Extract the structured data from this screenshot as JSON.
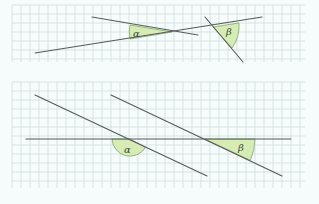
{
  "colors": {
    "background": "#f6fbfb",
    "grid": "#c9d6d4",
    "line": "#555a5a",
    "angle_fill": "#d6ecb4",
    "angle_stroke": "#7fa86a"
  },
  "panels": [
    {
      "name": "top-panel",
      "grid": {
        "x0": 12,
        "y0": 5,
        "x1": 305,
        "y1": 62,
        "step": 9
      },
      "angles": [
        {
          "label": "α",
          "label_x": 139,
          "label_y": 34
        },
        {
          "label": "β",
          "label_x": 228,
          "label_y": 33
        }
      ]
    },
    {
      "name": "bottom-panel",
      "grid": {
        "x0": 12,
        "y0": 82,
        "x1": 305,
        "y1": 188,
        "step": 9
      },
      "angles": [
        {
          "label": "α",
          "label_x": 126,
          "label_y": 154
        },
        {
          "label": "β",
          "label_x": 240,
          "label_y": 151
        }
      ]
    }
  ]
}
